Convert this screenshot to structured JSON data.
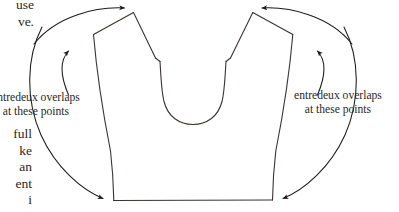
{
  "page": {
    "width": 399,
    "height": 212,
    "background": "#ffffff",
    "ink_color": "#2c2724"
  },
  "body_text": {
    "top_lines": [
      "use",
      "ve."
    ],
    "top_block": "use\nve.",
    "bottom_lines": [
      "full",
      "ke",
      "an",
      "ent",
      "i"
    ],
    "bottom_block": "full\nke\nan\nent\ni"
  },
  "callouts": [
    {
      "id": "callout-left",
      "line1": "entredeux overlaps",
      "line2": "at these points",
      "text": "entredeux overlaps\nat these points",
      "side": "left"
    },
    {
      "id": "callout-right",
      "line1": "entredeux overlaps",
      "line2": "at these points",
      "text": "entredeux overlaps\nat these points",
      "side": "right"
    }
  ],
  "diagram": {
    "type": "line-drawing",
    "stroke_color": "#3a3330",
    "stroke_width": 1.1,
    "fill": "none",
    "arrow_color": "#1d1a18",
    "shape_description": "symmetric bodice front with U-shaped neckline, shoulder peaks and straight hem",
    "annotation_targets": [
      "left-shoulder-peak",
      "right-shoulder-peak",
      "left-armhole-notch",
      "right-armhole-notch",
      "left-hem-corner",
      "right-hem-corner"
    ]
  }
}
